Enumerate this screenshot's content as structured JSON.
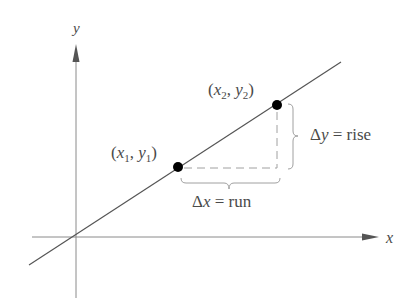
{
  "diagram": {
    "axes": {
      "x_label": "x",
      "y_label": "y"
    },
    "points": [
      {
        "name": "P1",
        "label_open": "(",
        "x_sym": "x",
        "x_sub": "1",
        "sep": ", ",
        "y_sym": "y",
        "y_sub": "1",
        "label_close": ")"
      },
      {
        "name": "P2",
        "label_open": "(",
        "x_sym": "x",
        "x_sub": "2",
        "sep": ", ",
        "y_sym": "y",
        "y_sub": "2",
        "label_close": ")"
      }
    ],
    "delta_x": {
      "delta": "Δ",
      "var": "x",
      "eq": " = ",
      "word": "run"
    },
    "delta_y": {
      "delta": "Δ",
      "var": "y",
      "eq": " = ",
      "word": "rise"
    },
    "colors": {
      "line": "#555555",
      "axis": "#888888",
      "dash": "#a0a0a0",
      "brace": "#a0a0a0",
      "point": "#000000",
      "text": "#4a4a4a"
    }
  }
}
